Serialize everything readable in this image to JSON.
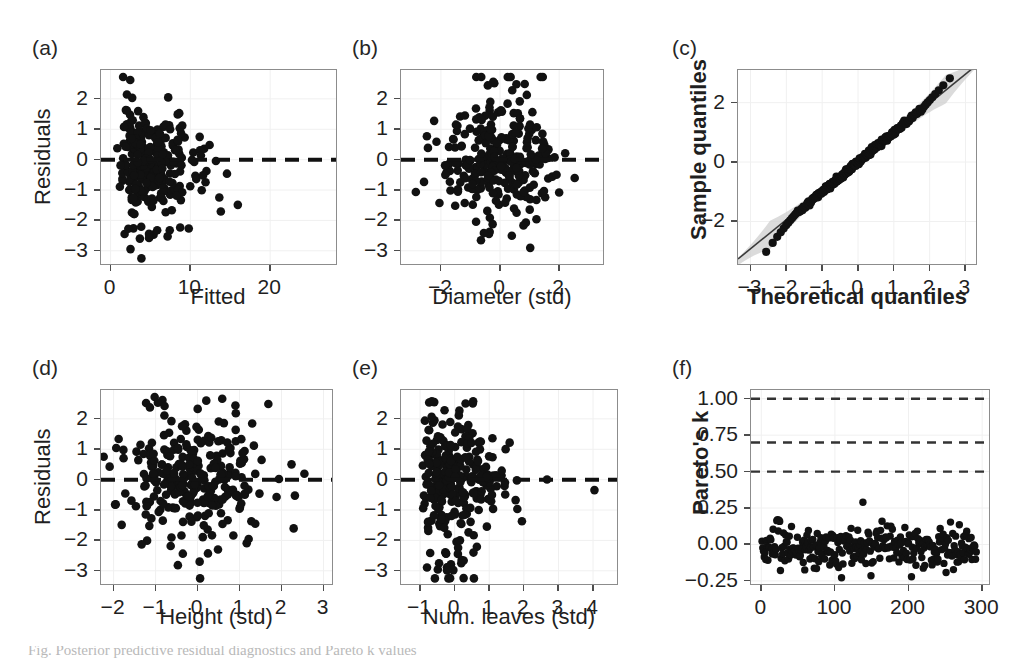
{
  "figure": {
    "background": "#ffffff",
    "dot_color": "#111111",
    "frame_color": "#8c8c8c",
    "band_color": "#cfcfcf",
    "partial_caption": "Fig. Posterior predictive residual diagnostics and Pareto k values"
  },
  "panels": [
    {
      "id": "a",
      "tag": "(a)",
      "ylabel": "Residuals",
      "xlabel": "Fitted",
      "ylabel_bold": false,
      "xlabel_bold": false,
      "xticks": [
        "0",
        "10",
        "20"
      ],
      "xtickvals": [
        0,
        10,
        20
      ],
      "yticks": [
        "2",
        "1",
        "0",
        "-1",
        "-2",
        "-3"
      ],
      "ytickvals": [
        2,
        1,
        0,
        -1,
        -2,
        -3
      ],
      "xlim": [
        -1.2,
        28.5
      ],
      "ylim": [
        -3.5,
        2.95
      ],
      "zero_line": 0
    },
    {
      "id": "b",
      "tag": "(b)",
      "ylabel": "",
      "xlabel": "Diameter (std)",
      "ylabel_bold": false,
      "xlabel_bold": false,
      "xticks": [
        "-2",
        "0",
        "2"
      ],
      "xtickvals": [
        -2,
        0,
        2
      ],
      "yticks": [
        "2",
        "1",
        "0",
        "-1",
        "-2",
        "-3"
      ],
      "ytickvals": [
        2,
        1,
        0,
        -1,
        -2,
        -3
      ],
      "xlim": [
        -3.35,
        3.55
      ],
      "ylim": [
        -3.5,
        2.95
      ],
      "zero_line": 0
    },
    {
      "id": "c",
      "tag": "(c)",
      "ylabel": "Sample quantiles",
      "xlabel": "Theoretical quantiles",
      "ylabel_bold": true,
      "xlabel_bold": true,
      "xticks": [
        "-3",
        "-2",
        "-1",
        "0",
        "1",
        "2",
        "3"
      ],
      "xtickvals": [
        -3,
        -2,
        -1,
        0,
        1,
        2,
        3
      ],
      "yticks": [
        "2",
        "0",
        "-2"
      ],
      "ytickvals": [
        2,
        0,
        -2
      ],
      "xlim": [
        -3.35,
        3.35
      ],
      "ylim": [
        -3.5,
        3.1
      ],
      "zero_line": null
    },
    {
      "id": "d",
      "tag": "(d)",
      "ylabel": "Residuals",
      "xlabel": "Height (std)",
      "ylabel_bold": false,
      "xlabel_bold": false,
      "xticks": [
        "-2",
        "-1",
        "0",
        "1",
        "2",
        "3"
      ],
      "xtickvals": [
        -2,
        -1,
        0,
        1,
        2,
        3
      ],
      "yticks": [
        "2",
        "1",
        "0",
        "-1",
        "-2",
        "-3"
      ],
      "ytickvals": [
        2,
        1,
        0,
        -1,
        -2,
        -3
      ],
      "xlim": [
        -2.3,
        3.25
      ],
      "ylim": [
        -3.5,
        2.95
      ],
      "zero_line": 0
    },
    {
      "id": "e",
      "tag": "(e)",
      "ylabel": "",
      "xlabel": "Num. leaves (std)",
      "ylabel_bold": false,
      "xlabel_bold": false,
      "xticks": [
        "-1",
        "0",
        "1",
        "2",
        "3",
        "4"
      ],
      "xtickvals": [
        -1,
        0,
        1,
        2,
        3,
        4
      ],
      "yticks": [
        "2",
        "1",
        "0",
        "-1",
        "-2",
        "-3"
      ],
      "ytickvals": [
        2,
        1,
        0,
        -1,
        -2,
        -3
      ],
      "xlim": [
        -1.55,
        4.75
      ],
      "ylim": [
        -3.5,
        2.95
      ],
      "zero_line": 0
    },
    {
      "id": "f",
      "tag": "(f)",
      "ylabel": "Pareto's k",
      "xlabel": "",
      "ylabel_bold": true,
      "xlabel_bold": false,
      "xticks": [
        "0",
        "100",
        "200",
        "300"
      ],
      "xtickvals": [
        0,
        100,
        200,
        300
      ],
      "yticks": [
        "1.00",
        "0.75",
        "0.50",
        "0.25",
        "0.00",
        "-0.25"
      ],
      "ytickvals": [
        1.0,
        0.75,
        0.5,
        0.25,
        0.0,
        -0.25
      ],
      "xlim": [
        -14,
        312
      ],
      "ylim": [
        -0.285,
        1.06
      ],
      "zero_line": null,
      "threshold_lines": [
        1.0,
        0.7,
        0.5
      ]
    }
  ],
  "chart_data": [
    {
      "panel": "a",
      "type": "scatter",
      "title": "Residuals vs Fitted",
      "xlabel": "Fitted",
      "ylabel": "Residuals",
      "xlim": [
        -1.2,
        28.5
      ],
      "ylim": [
        -3.5,
        2.95
      ],
      "xticks": [
        0,
        10,
        20
      ],
      "yticks": [
        2,
        1,
        0,
        -1,
        -2,
        -3
      ],
      "n_points": 290,
      "grid": false,
      "reference_line": {
        "type": "horizontal-dashed",
        "y": 0
      },
      "description": "Residual cloud densest between fitted 1 and 8, spreading from -3.2 to 2.7; long right tail of sparse points out to fitted 27 with residuals near -1 to -1.5.",
      "generator": {
        "kind": "fitted-residual",
        "seed": 17,
        "x_shape": 1.55,
        "x_scale": 3.1,
        "x_max": 27.5,
        "y_sd": 0.95
      }
    },
    {
      "panel": "b",
      "type": "scatter",
      "title": "Residuals vs Diameter (std)",
      "xlabel": "Diameter (std)",
      "ylabel": "Residuals",
      "xlim": [
        -3.35,
        3.55
      ],
      "ylim": [
        -3.5,
        2.95
      ],
      "xticks": [
        -2,
        0,
        2
      ],
      "yticks": [
        2,
        1,
        0,
        -1,
        -2,
        -3
      ],
      "n_points": 290,
      "grid": false,
      "reference_line": {
        "type": "horizontal-dashed",
        "y": 0
      },
      "description": "Roughly symmetric cloud centred near x=0, residual spread -3.2 to 2.7, slight left-tail outliers near x=-2.",
      "generator": {
        "kind": "std-residual",
        "seed": 29,
        "x_sd": 0.92,
        "x_skew": 0.25,
        "y_sd": 0.95
      }
    },
    {
      "panel": "c",
      "type": "scatter",
      "title": "Normal Q-Q plot",
      "xlabel": "Theoretical quantiles",
      "ylabel": "Sample quantiles",
      "xlim": [
        -3.35,
        3.35
      ],
      "ylim": [
        -3.5,
        3.1
      ],
      "xticks": [
        -3,
        -2,
        -1,
        0,
        1,
        2,
        3
      ],
      "yticks": [
        -2,
        0,
        2
      ],
      "n_points": 290,
      "grid": false,
      "reference_line": {
        "type": "identity",
        "slope": 0.98,
        "intercept": 0.02
      },
      "confidence_band": true,
      "description": "Points follow the reference line closely; mild departure below the line at the lower tail (theoretical < -1.8) and slight flattening above at the upper tail (theoretical > 1.9) with a grey pointwise confidence band widening at the extremes.",
      "generator": {
        "kind": "qq",
        "seed": 41,
        "lower_tail_drop": 0.55,
        "upper_tail_lift": 0.32
      }
    },
    {
      "panel": "d",
      "type": "scatter",
      "title": "Residuals vs Height (std)",
      "xlabel": "Height (std)",
      "ylabel": "Residuals",
      "xlim": [
        -2.3,
        3.25
      ],
      "ylim": [
        -3.5,
        2.95
      ],
      "xticks": [
        -2,
        -1,
        0,
        1,
        2,
        3
      ],
      "yticks": [
        2,
        1,
        0,
        -1,
        -2,
        -3
      ],
      "n_points": 290,
      "grid": false,
      "reference_line": {
        "type": "horizontal-dashed",
        "y": 0
      },
      "description": "Dense symmetric cloud centred near x=-0.2 with residuals -3.2 to 2.7; a cluster of low outliers near x=-1.7.",
      "generator": {
        "kind": "std-residual",
        "seed": 53,
        "x_sd": 0.95,
        "x_skew": 0.18,
        "y_sd": 0.95
      }
    },
    {
      "panel": "e",
      "type": "scatter",
      "title": "Residuals vs Num. leaves (std)",
      "xlabel": "Num. leaves (std)",
      "ylabel": "Residuals",
      "xlim": [
        -1.55,
        4.75
      ],
      "ylim": [
        -3.5,
        2.95
      ],
      "xticks": [
        -1,
        0,
        1,
        2,
        3,
        4
      ],
      "yticks": [
        2,
        1,
        0,
        -1,
        -2,
        -3
      ],
      "n_points": 290,
      "grid": false,
      "reference_line": {
        "type": "horizontal-dashed",
        "y": 0
      },
      "description": "Strongly right-skewed predictor: heavy mass between -1 and 0.5, thinning tail out to 4.6 with residuals tightening toward zero.",
      "generator": {
        "kind": "skew-residual",
        "seed": 67,
        "x_shape": 1.35,
        "x_scale": 0.75,
        "x_shift": -1.05,
        "x_max": 4.6,
        "y_sd": 0.95
      }
    },
    {
      "panel": "f",
      "type": "scatter",
      "title": "Pareto k diagnostic",
      "xlabel": "",
      "ylabel": "Pareto's k",
      "xlim": [
        -14,
        312
      ],
      "ylim": [
        -0.285,
        1.06
      ],
      "xticks": [
        0,
        100,
        200,
        300
      ],
      "yticks": [
        1.0,
        0.75,
        0.5,
        0.25,
        0.0,
        -0.25
      ],
      "n_points": 292,
      "grid": false,
      "threshold_lines": [
        1.0,
        0.7,
        0.5
      ],
      "threshold_style": "dashed",
      "description": "All 292 Pareto k values lie well below 0.5; they scatter around 0.0 between about -0.22 and 0.29, with a single high point near index 137 at k = 0.29.",
      "generator": {
        "kind": "pareto-k",
        "seed": 83,
        "n": 292,
        "center": -0.02,
        "sd": 0.075,
        "max_outlier": {
          "index": 137,
          "value": 0.29
        }
      }
    }
  ]
}
